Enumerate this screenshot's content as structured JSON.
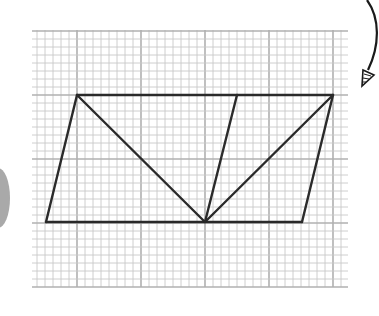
{
  "figure": {
    "colors": {
      "background": "#ffffff",
      "grid_minor": "#c8c8c8",
      "grid_major": "#b0b0b0",
      "shape_stroke": "#2a2a2a",
      "decor_blob": "#a9a9a9",
      "arrow": "#1a1a1a"
    },
    "grid": {
      "minor_per_major": 8
    },
    "shape": {
      "type": "parallelogram",
      "vertices": [
        "top-left",
        "top-right",
        "bottom-right",
        "bottom-left"
      ],
      "segments": [
        {
          "name": "top-edge"
        },
        {
          "name": "right-edge"
        },
        {
          "name": "bottom-edge"
        },
        {
          "name": "left-edge"
        },
        {
          "name": "diagonal-top-left-to-bottom-mid"
        },
        {
          "name": "diagonal-top-right-to-bottom-mid"
        },
        {
          "name": "inner-slant-edge"
        }
      ]
    },
    "decorations": [
      {
        "name": "curved-arrow",
        "icon": "curved-arrow-icon"
      },
      {
        "name": "gray-blob",
        "icon": "half-circle"
      }
    ]
  }
}
